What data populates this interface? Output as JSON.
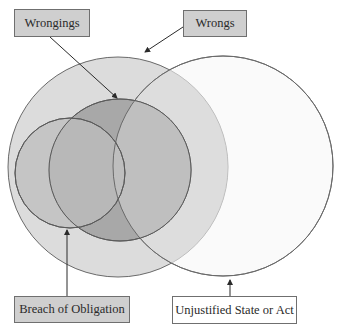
{
  "labels": {
    "wrongings": "Wrongings",
    "wrongs": "Wrongs",
    "breach": "Breach of Obligation",
    "unjustified": "Unjustified State or Act"
  },
  "colors": {
    "wrongs_fill": "#dcdcdc",
    "unjustified_fill": "#f6f6f6",
    "wrongings_fill": "#a9a9a9",
    "breach_fill": "#bdbdbd",
    "stroke": "#5a5a5a",
    "label_box_fill": "#cfcfcf",
    "arrow": "#2a2a2a"
  },
  "sets": [
    {
      "name": "Wrongs",
      "cx": 118,
      "cy": 167,
      "r": 110
    },
    {
      "name": "Unjustified State or Act",
      "cx": 223,
      "cy": 166,
      "r": 110
    },
    {
      "name": "Wrongings",
      "cx": 120,
      "cy": 170,
      "r": 71
    },
    {
      "name": "Breach of Obligation",
      "cx": 70,
      "cy": 173,
      "r": 55
    }
  ]
}
